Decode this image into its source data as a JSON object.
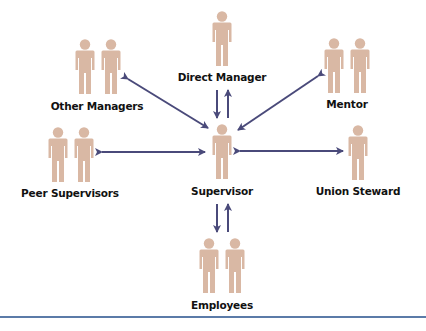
{
  "colors": {
    "person": "#d9b8a4",
    "arrow": "#4a4a7a",
    "rule": "#5b7ba8",
    "text": "#111111"
  },
  "nodes": {
    "direct_manager": {
      "label": "Direct Manager",
      "count": 1
    },
    "other_managers": {
      "label": "Other Managers",
      "count": 2
    },
    "mentor": {
      "label": "Mentor",
      "count": 2
    },
    "peer_supervisors": {
      "label": "Peer Supervisors",
      "count": 2
    },
    "supervisor": {
      "label": "Supervisor",
      "count": 1
    },
    "union_steward": {
      "label": "Union Steward",
      "count": 1
    },
    "employees": {
      "label": "Employees",
      "count": 2
    }
  },
  "edges": [
    {
      "from": "supervisor",
      "to": "direct_manager",
      "type": "two-way (parallel arrows)"
    },
    {
      "from": "supervisor",
      "to": "other_managers",
      "type": "bidirectional"
    },
    {
      "from": "supervisor",
      "to": "mentor",
      "type": "bidirectional"
    },
    {
      "from": "supervisor",
      "to": "peer_supervisors",
      "type": "bidirectional"
    },
    {
      "from": "supervisor",
      "to": "union_steward",
      "type": "bidirectional"
    },
    {
      "from": "supervisor",
      "to": "employees",
      "type": "two-way (parallel arrows)"
    }
  ]
}
